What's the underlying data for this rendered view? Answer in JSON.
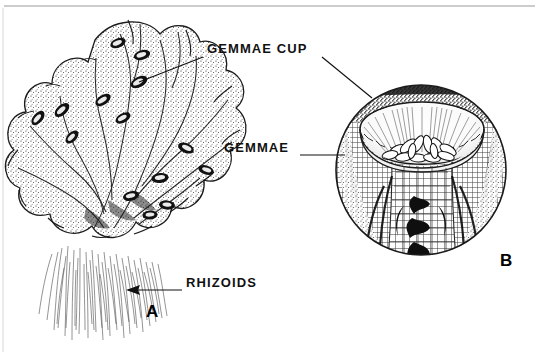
{
  "figure": {
    "background_color": "#ffffff",
    "ink_color": "#000000",
    "rule_color": "#9a9a9a",
    "width": 539,
    "height": 355
  },
  "labels": [
    {
      "id": "gemmae-cup",
      "text": "GEMMAE CUP",
      "x": 207,
      "y": 49,
      "leaders": [
        {
          "from": [
            203,
            57
          ],
          "to": [
            139,
            82
          ]
        },
        {
          "from": [
            322,
            57
          ],
          "to": [
            372,
            98
          ]
        }
      ]
    },
    {
      "id": "gemmae",
      "text": "GEMMAE",
      "x": 224,
      "y": 148,
      "leaders": [
        {
          "from": [
            300,
            155
          ],
          "to": [
            345,
            155
          ]
        }
      ]
    },
    {
      "id": "rhizoids",
      "text": "RHIZOIDS",
      "x": 186,
      "y": 283,
      "leaders": [
        {
          "from": [
            182,
            290
          ],
          "to": [
            126,
            290
          ]
        }
      ],
      "arrow_at": [
        126,
        290
      ]
    }
  ],
  "panels": [
    {
      "id": "panel-a",
      "letter": "A",
      "x": 146,
      "y": 311,
      "subject": "whole thallus with rhizoids"
    },
    {
      "id": "panel-b",
      "letter": "B",
      "x": 500,
      "y": 260,
      "subject": "gemma cup cross-section"
    }
  ],
  "frame": {
    "top_rule": {
      "x1": 4,
      "y1": 6,
      "x2": 535,
      "y2": 6
    },
    "left_rule": {
      "x1": 3,
      "y1": 6,
      "x2": 3,
      "y2": 352
    }
  },
  "thallus": {
    "description": "Lobed liverwort thallus, stippled, with dark elliptical gemma cups",
    "gemma_cup_count": 14
  },
  "inset": {
    "description": "Circular magnified cross-section of a gemma cup",
    "center": [
      421,
      170
    ],
    "radius": 86,
    "cup_rim_color": "#ffffff",
    "gemmae_count": 13
  }
}
